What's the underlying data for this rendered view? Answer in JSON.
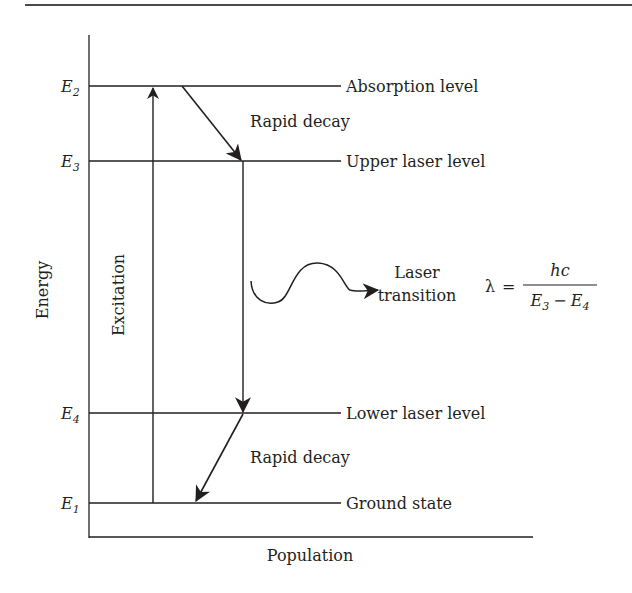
{
  "diagram": {
    "type": "energy-level-diagram",
    "colors": {
      "ink": "#231f20",
      "background": "#ffffff",
      "rule": "#3a3a3a"
    },
    "axes": {
      "y_label": "Energy",
      "x_label": "Population"
    },
    "levels": [
      {
        "symbol": "E",
        "subscript": "2",
        "name": "Absorption level",
        "y": 86
      },
      {
        "symbol": "E",
        "subscript": "3",
        "name": "Upper laser level",
        "y": 161
      },
      {
        "symbol": "E",
        "subscript": "4",
        "name": "Lower laser level",
        "y": 413
      },
      {
        "symbol": "E",
        "subscript": "1",
        "name": "Ground state",
        "y": 503
      }
    ],
    "transitions": [
      {
        "label": "Excitation",
        "from": "E1",
        "to": "E2",
        "style": "vertical-up"
      },
      {
        "label": "Rapid decay",
        "from": "E2",
        "to": "E3",
        "style": "diagonal-down"
      },
      {
        "label": "Laser transition",
        "from": "E3",
        "to": "E4",
        "style": "vertical-down"
      },
      {
        "label": "Rapid decay",
        "from": "E4",
        "to": "E1",
        "style": "diagonal-down"
      }
    ],
    "laser_label": {
      "line1": "Laser",
      "line2": "transition"
    },
    "decay_labels": {
      "upper": "Rapid decay",
      "lower": "Rapid decay"
    },
    "excitation_label": "Excitation",
    "formula": {
      "lhs": "λ",
      "equals": "=",
      "numerator": "hc",
      "denominator": {
        "a": "E",
        "a_sub": "3",
        "minus": "−",
        "b": "E",
        "b_sub": "4"
      }
    }
  }
}
